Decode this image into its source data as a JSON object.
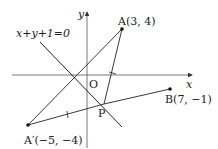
{
  "diagram": {
    "type": "coordinate-geometry",
    "axes": {
      "x_label": "x",
      "y_label": "y",
      "origin_label": "O"
    },
    "line": {
      "equation_label": "x+y+1=0"
    },
    "points": {
      "A": {
        "label": "A(3, 4)",
        "x": 3,
        "y": 4
      },
      "B": {
        "label": "B(7, −1)",
        "x": 7,
        "y": -1
      },
      "A_prime": {
        "label": "A′(−5, −4)",
        "x": -5,
        "y": -4
      },
      "P": {
        "label": "P"
      }
    },
    "segments": [
      "A–A′",
      "A–P",
      "A′–P",
      "P–B"
    ],
    "colors": {
      "stroke": "#222222",
      "axis": "#444444",
      "background": "#ffffff"
    }
  }
}
